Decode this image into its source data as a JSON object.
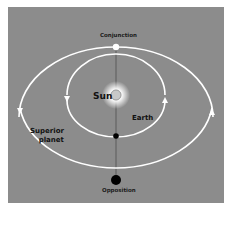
{
  "diagram": {
    "labels": {
      "conjunction": "Conjunction",
      "opposition": "Opposition",
      "sun": "Sun",
      "earth": "Earth",
      "superior_line1": "Superior",
      "superior_line2": "planet"
    },
    "colors": {
      "background": "#8c8c8c",
      "orbit": "#ffffff",
      "text": "#111111",
      "planet_dot_opposition": "#000000",
      "planet_dot_conjunction": "#ffffff",
      "earth_dot": "#000000",
      "sun_glow": "#ffffff"
    },
    "orbits": [
      {
        "name": "earth-orbit",
        "cx": 116,
        "cy": 95,
        "rx": 49,
        "ry": 41,
        "direction": "counterclockwise"
      },
      {
        "name": "superior-planet-orbit",
        "cx": 116,
        "cy": 117,
        "rx": 97,
        "ry": 70,
        "direction": "counterclockwise"
      }
    ],
    "positions": {
      "conjunction_planet": [
        116,
        47
      ],
      "sun": [
        116,
        95
      ],
      "earth": [
        116,
        136
      ],
      "opposition_planet": [
        116,
        180
      ]
    }
  }
}
